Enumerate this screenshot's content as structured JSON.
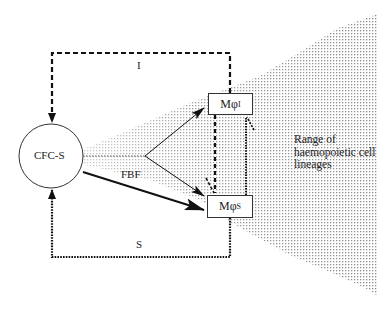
{
  "diagram": {
    "nodes": {
      "stem_cell": {
        "label": "CFC-S",
        "shape": "circle"
      },
      "macrophage_inhibitor": {
        "label_main": "Mφ",
        "label_sub": "I",
        "shape": "box"
      },
      "macrophage_stimulator": {
        "label_main": "Mφ",
        "label_sub": "S",
        "shape": "box"
      }
    },
    "edges": {
      "inhibition_loop": {
        "label": "I",
        "style": "dashed",
        "from": "Mφ_I",
        "to": "CFC-S"
      },
      "stimulation_loop": {
        "label": "S",
        "style": "dotted",
        "from": "Mφ_S",
        "to": "CFC-S"
      },
      "fbf_arrow": {
        "label": "FBF",
        "style": "thick",
        "from": "CFC-S",
        "to": "Mφ_S"
      },
      "branch_to_mphi_i": {
        "style": "thin",
        "from": "CFC-S",
        "to": "Mφ_I"
      },
      "branch_to_mphi_s": {
        "style": "thin",
        "from": "CFC-S",
        "to": "Mφ_S"
      },
      "mphi_i_to_mphi_s": {
        "style": "dashed"
      },
      "mphi_s_to_mphi_i": {
        "style": "dotted"
      }
    },
    "annotation": {
      "range_label": "Range of haemopoietic cell lineages"
    },
    "colors": {
      "line": "#111111",
      "shading": "#9a9a9a",
      "background": "#ffffff"
    }
  }
}
